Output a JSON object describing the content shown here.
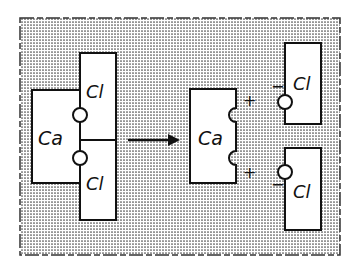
{
  "diagram": {
    "colors": {
      "background": "#ffffff",
      "stipple": "#444444",
      "box_fill": "#ffffff",
      "stroke": "#111111"
    },
    "before": {
      "cation": {
        "label": "Ca"
      },
      "anions": [
        {
          "label": "Cl"
        },
        {
          "label": "Cl"
        }
      ]
    },
    "arrow": {
      "direction": "right",
      "meaning": "dissociates into"
    },
    "after": {
      "cation": {
        "label": "Ca",
        "charges": [
          "+",
          "+"
        ]
      },
      "anions": [
        {
          "label": "Cl",
          "charge": "−"
        },
        {
          "label": "Cl",
          "charge": "−"
        }
      ]
    }
  }
}
